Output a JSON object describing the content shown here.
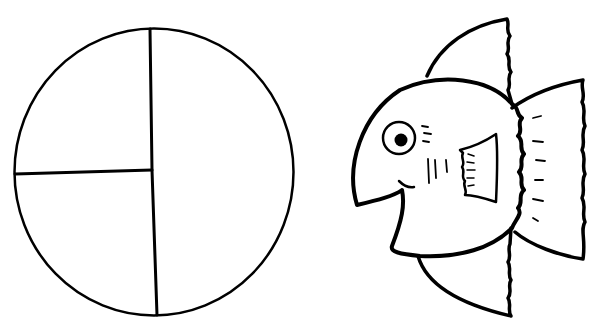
{
  "canvas": {
    "width": 604,
    "height": 335,
    "background": "#ffffff",
    "ink": "#000000"
  },
  "figures": [
    {
      "name": "divided-circle",
      "description": "Circle divided into one half and two quarters",
      "sections": [
        "half",
        "quarter",
        "quarter"
      ]
    },
    {
      "name": "fish",
      "description": "Cartoon fish outline with fins, eye and gills"
    }
  ]
}
